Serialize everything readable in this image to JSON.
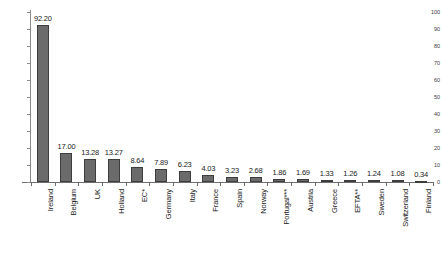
{
  "chart_data": {
    "type": "bar",
    "title": "",
    "xlabel": "",
    "ylabel": "",
    "ylim": [
      0,
      100
    ],
    "ytick_step": 10,
    "yticks": [
      0,
      10,
      20,
      30,
      40,
      50,
      60,
      70,
      80,
      90,
      100
    ],
    "ytick_labels": [
      "0",
      "10",
      "20",
      "30",
      "40",
      "50",
      "60",
      "70",
      "80",
      "90",
      "100"
    ],
    "grid": false,
    "legend": "none",
    "bar_color": "#6b6b6b",
    "bar_border_color": "#3d3d3d",
    "axis_color": "#6e6e6e",
    "categories": [
      "Ireland",
      "Belgium",
      "UK",
      "Holland",
      "EC*",
      "Germany",
      "Italy",
      "France",
      "Spain",
      "Norway",
      "Portugal***",
      "Austria",
      "Greece",
      "EFTA**",
      "Sweden",
      "Switzerland",
      "Finland"
    ],
    "values": [
      92.2,
      17.0,
      13.28,
      13.27,
      8.64,
      7.89,
      6.23,
      4.03,
      3.23,
      2.68,
      1.86,
      1.69,
      1.33,
      1.26,
      1.24,
      1.08,
      0.34
    ],
    "value_labels": [
      "92.20",
      "17.00",
      "13.28",
      "13.27",
      "8.64",
      "7.89",
      "6.23",
      "4.03",
      "3.23",
      "2.68",
      "1.86",
      "1.69",
      "1.33",
      "1.26",
      "1.24",
      "1.08",
      "0.34"
    ]
  }
}
